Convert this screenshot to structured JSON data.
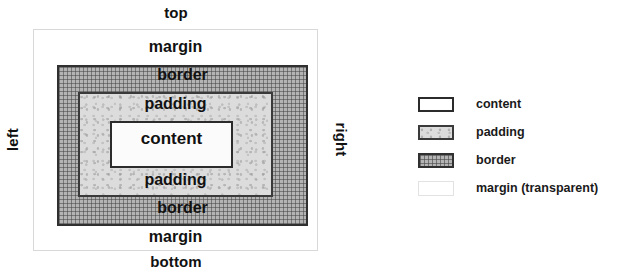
{
  "diagram": {
    "edge_labels": {
      "top": "top",
      "bottom": "bottom",
      "left": "left",
      "right": "right"
    },
    "regions": {
      "margin_top": "margin",
      "border_top": "border",
      "padding_top": "padding",
      "content": "content",
      "padding_bottom": "padding",
      "border_bottom": "border",
      "margin_bottom": "margin"
    },
    "colors": {
      "content_fill": "#fbfbfb",
      "content_stroke": "#2b2b2b",
      "padding_fill": "#dcdcdc",
      "padding_stroke": "#3a3a3a",
      "border_fill": "#b4b4b4",
      "border_stroke": "#303030",
      "margin_fill": "#ffffff",
      "margin_stroke": "#d8d8d8",
      "text": "#111111"
    }
  },
  "legend": {
    "items": [
      {
        "label": "content",
        "swatch": "content-swatch"
      },
      {
        "label": "padding",
        "swatch": "padding-swatch"
      },
      {
        "label": "border",
        "swatch": "border-swatch"
      },
      {
        "label": "margin (transparent)",
        "swatch": "margin-swatch"
      }
    ]
  }
}
